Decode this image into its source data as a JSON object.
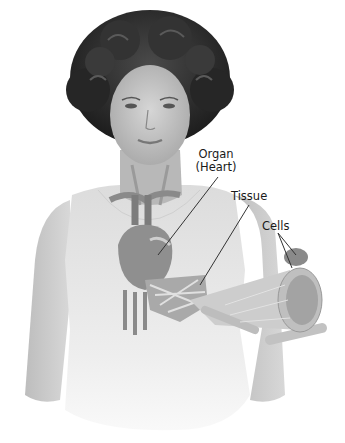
{
  "diagram": {
    "labels": {
      "organ_line1": "Organ",
      "organ_line2": "(Heart)",
      "tissue": "Tissue",
      "cells": "Cells"
    },
    "colors": {
      "background": "#ffffff",
      "hair": "#2b2b2b",
      "skin": "#c9c9c9",
      "torso": "#e6e6e6",
      "heart": "#8f8f8f",
      "leader_line": "#333333"
    }
  }
}
